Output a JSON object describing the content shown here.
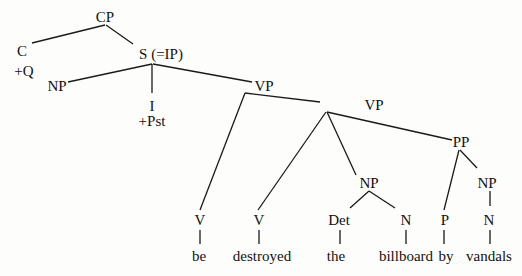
{
  "diagram": {
    "type": "syntax-tree",
    "nodes": [
      {
        "id": "cp",
        "label": "CP",
        "x": 105,
        "y": 17
      },
      {
        "id": "c",
        "label": "C",
        "x": 22,
        "y": 51
      },
      {
        "id": "c_feat",
        "label": "+Q",
        "x": 24,
        "y": 71
      },
      {
        "id": "s",
        "label": "S (=IP)",
        "x": 161,
        "y": 54
      },
      {
        "id": "np_subj",
        "label": "NP",
        "x": 57,
        "y": 86
      },
      {
        "id": "i",
        "label": "I",
        "x": 152,
        "y": 106
      },
      {
        "id": "i_feat",
        "label": "+Pst",
        "x": 152,
        "y": 121
      },
      {
        "id": "vp1",
        "label": "VP",
        "x": 264,
        "y": 86
      },
      {
        "id": "vp2",
        "label": "VP",
        "x": 374,
        "y": 105
      },
      {
        "id": "pp",
        "label": "PP",
        "x": 461,
        "y": 142
      },
      {
        "id": "np_obj",
        "label": "NP",
        "x": 369,
        "y": 183
      },
      {
        "id": "np_by",
        "label": "NP",
        "x": 487,
        "y": 183
      },
      {
        "id": "v_be",
        "label": "V",
        "x": 200,
        "y": 220
      },
      {
        "id": "v_destroyed",
        "label": "V",
        "x": 259,
        "y": 220
      },
      {
        "id": "det",
        "label": "Det",
        "x": 339,
        "y": 220
      },
      {
        "id": "n_billboard",
        "label": "N",
        "x": 406,
        "y": 220
      },
      {
        "id": "p",
        "label": "P",
        "x": 445,
        "y": 220
      },
      {
        "id": "n_vandals",
        "label": "N",
        "x": 489,
        "y": 220
      },
      {
        "id": "w_be",
        "label": "be",
        "x": 199,
        "y": 256
      },
      {
        "id": "w_destroyed",
        "label": "destroyed",
        "x": 262,
        "y": 256
      },
      {
        "id": "w_the",
        "label": "the",
        "x": 336,
        "y": 256
      },
      {
        "id": "w_billboard",
        "label": "billboard",
        "x": 406,
        "y": 256
      },
      {
        "id": "w_by",
        "label": "by",
        "x": 446,
        "y": 256
      },
      {
        "id": "w_vandals",
        "label": "vandals",
        "x": 489,
        "y": 256
      }
    ],
    "edges": [
      {
        "from": "cp",
        "to": "c",
        "x1": 105,
        "y1": 25,
        "x2": 32,
        "y2": 43
      },
      {
        "from": "cp",
        "to": "s",
        "x1": 106,
        "y1": 25,
        "x2": 133,
        "y2": 44
      },
      {
        "from": "s",
        "to": "np_subj",
        "x1": 152,
        "y1": 64,
        "x2": 68,
        "y2": 82
      },
      {
        "from": "s",
        "to": "i",
        "x1": 152,
        "y1": 64,
        "x2": 152,
        "y2": 93
      },
      {
        "from": "s",
        "to": "vp1",
        "x1": 153,
        "y1": 64,
        "x2": 252,
        "y2": 82
      },
      {
        "from": "vp1",
        "to": "v_be",
        "x1": 245,
        "y1": 93,
        "x2": 200,
        "y2": 210
      },
      {
        "from": "vp1",
        "to": "vp2",
        "x1": 245,
        "y1": 93,
        "x2": 320,
        "y2": 102
      },
      {
        "from": "vp2",
        "to": "v_destroyed",
        "x1": 326,
        "y1": 112,
        "x2": 258,
        "y2": 210
      },
      {
        "from": "vp2",
        "to": "np_obj",
        "x1": 327,
        "y1": 112,
        "x2": 356,
        "y2": 175
      },
      {
        "from": "vp2",
        "to": "pp",
        "x1": 327,
        "y1": 112,
        "x2": 452,
        "y2": 140
      },
      {
        "from": "pp",
        "to": "p",
        "x1": 459,
        "y1": 150,
        "x2": 444,
        "y2": 210
      },
      {
        "from": "pp",
        "to": "np_by",
        "x1": 460,
        "y1": 150,
        "x2": 477,
        "y2": 168
      },
      {
        "from": "np_obj",
        "to": "det",
        "x1": 369,
        "y1": 191,
        "x2": 350,
        "y2": 208
      },
      {
        "from": "np_obj",
        "to": "n_billboard",
        "x1": 369,
        "y1": 191,
        "x2": 395,
        "y2": 208
      },
      {
        "from": "np_by",
        "to": "n_vandals",
        "x1": 490,
        "y1": 191,
        "x2": 490,
        "y2": 206
      },
      {
        "from": "v_be",
        "to": "w_be",
        "x1": 200,
        "y1": 230,
        "x2": 200,
        "y2": 244
      },
      {
        "from": "v_destroyed",
        "to": "w_destroyed",
        "x1": 259,
        "y1": 230,
        "x2": 259,
        "y2": 244
      },
      {
        "from": "det",
        "to": "w_the",
        "x1": 340,
        "y1": 230,
        "x2": 340,
        "y2": 244
      },
      {
        "from": "n_billboard",
        "to": "w_billboard",
        "x1": 406,
        "y1": 230,
        "x2": 406,
        "y2": 244
      },
      {
        "from": "p",
        "to": "w_by",
        "x1": 444,
        "y1": 230,
        "x2": 444,
        "y2": 244
      },
      {
        "from": "n_vandals",
        "to": "w_vandals",
        "x1": 490,
        "y1": 230,
        "x2": 490,
        "y2": 244
      }
    ]
  }
}
